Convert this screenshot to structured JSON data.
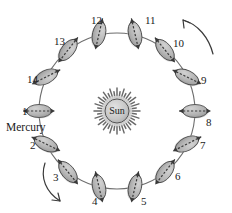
{
  "diagram": {
    "center_body": {
      "name": "sun",
      "label": "Sun",
      "cx": 117,
      "cy": 111,
      "core_r": 12,
      "ray_outer_r": 23,
      "ray_count": 40,
      "fill": "#c9c9c9",
      "stroke": "#555555"
    },
    "orbit": {
      "cx": 117,
      "cy": 111,
      "r": 78,
      "stroke": "#6d6d6d",
      "stroke_width": 1.1,
      "fill": "none"
    },
    "planet_style": {
      "fill": "#b6b6b6",
      "stroke": "#4d4d4d",
      "rx": 12.5,
      "ry": 6.5,
      "axis_stroke": "#3a3a3a"
    },
    "planet_label_name": "Mercury",
    "positions": [
      {
        "id": "1",
        "label": "1",
        "angle_deg": 180,
        "x": 39,
        "y": 111,
        "axis_deg": 0,
        "label_x": 22,
        "label_y": 106
      },
      {
        "id": "2",
        "label": "2",
        "angle_deg": 205,
        "x": 46,
        "y": 144,
        "axis_deg": 26,
        "label_x": 30,
        "label_y": 140
      },
      {
        "id": "3",
        "label": "3",
        "angle_deg": 231,
        "x": 68,
        "y": 172,
        "axis_deg": 51,
        "label_x": 53,
        "label_y": 172
      },
      {
        "id": "4",
        "label": "4",
        "angle_deg": 257,
        "x": 99,
        "y": 187,
        "axis_deg": 77,
        "label_x": 92,
        "label_y": 196
      },
      {
        "id": "5",
        "label": "5",
        "angle_deg": 283,
        "x": 135,
        "y": 187,
        "axis_deg": 103,
        "label_x": 141,
        "label_y": 196
      },
      {
        "id": "6",
        "label": "6",
        "angle_deg": 308,
        "x": 165,
        "y": 172,
        "axis_deg": 128,
        "label_x": 175,
        "label_y": 171
      },
      {
        "id": "7",
        "label": "7",
        "angle_deg": 333,
        "x": 187,
        "y": 144,
        "axis_deg": 153,
        "label_x": 200,
        "label_y": 140
      },
      {
        "id": "8",
        "label": "8",
        "angle_deg": 0,
        "x": 195,
        "y": 111,
        "axis_deg": 0,
        "label_x": 206,
        "label_y": 117
      },
      {
        "id": "9",
        "label": "9",
        "angle_deg": 26,
        "x": 187,
        "y": 77,
        "axis_deg": 26,
        "label_x": 201,
        "label_y": 75
      },
      {
        "id": "10",
        "label": "10",
        "angle_deg": 51,
        "x": 165,
        "y": 50,
        "axis_deg": 51,
        "label_x": 173,
        "label_y": 38
      },
      {
        "id": "11",
        "label": "11",
        "angle_deg": 77,
        "x": 135,
        "y": 34,
        "axis_deg": 77,
        "label_x": 145,
        "label_y": 15
      },
      {
        "id": "12",
        "label": "12",
        "angle_deg": 103,
        "x": 99,
        "y": 34,
        "axis_deg": 103,
        "label_x": 91,
        "label_y": 15
      },
      {
        "id": "13",
        "label": "13",
        "angle_deg": 128,
        "x": 68,
        "y": 50,
        "axis_deg": 128,
        "label_x": 54,
        "label_y": 36
      },
      {
        "id": "14",
        "label": "14",
        "angle_deg": 153,
        "x": 46,
        "y": 77,
        "axis_deg": 153,
        "label_x": 27,
        "label_y": 74
      }
    ],
    "mercury_label": {
      "text": "Mercury",
      "x": 6,
      "y": 122
    },
    "direction_arrows": [
      {
        "name": "direction-arrow-top-right",
        "path": "M 183 20 C 198 24 209 38 213 54",
        "arrow_tip": "183,20",
        "arrow_head": "M 183 20 L 190 23 M 183 20 L 184 28",
        "stroke": "#3a3a3a"
      },
      {
        "name": "direction-arrow-bottom-left",
        "path": "M 45 163 C 40 178 46 192 60 201",
        "arrow_tip": "60,201",
        "arrow_head": "M 60 201 L 52 200 M 60 201 L 58 193",
        "stroke": "#3a3a3a"
      }
    ]
  }
}
